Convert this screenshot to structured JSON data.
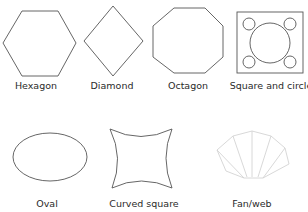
{
  "diagram": {
    "title": "",
    "shapes": [
      {
        "id": "hexagon",
        "label": "Hexagon"
      },
      {
        "id": "diamond",
        "label": "Diamond"
      },
      {
        "id": "octagon",
        "label": "Octagon"
      },
      {
        "id": "square-and-circle",
        "label": "Square and circle"
      },
      {
        "id": "oval",
        "label": "Oval"
      },
      {
        "id": "curved-square",
        "label": "Curved square"
      },
      {
        "id": "fan-web",
        "label": "Fan/web"
      }
    ]
  },
  "colors": {
    "stroke": "#555555",
    "fan_stroke": "#d4d4d4",
    "text": "#2a2a2a",
    "background": "#ffffff"
  }
}
